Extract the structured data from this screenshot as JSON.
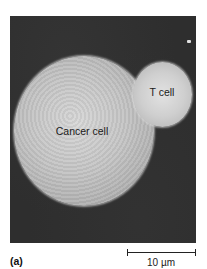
{
  "figure": {
    "panel_label": "(a)",
    "labels": {
      "t_cell": "T cell",
      "cancer_cell": "Cancer cell"
    },
    "scale_bar": {
      "label": "10 µm"
    },
    "colors": {
      "background": "#2e2e2e",
      "cell_surface": "#c8c8c8",
      "text": "#1a1a1a"
    }
  }
}
